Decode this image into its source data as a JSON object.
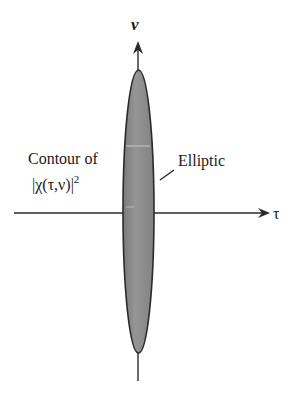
{
  "diagram": {
    "type": "ambiguity-function-contour",
    "axes": {
      "vertical_label": "ν",
      "horizontal_label": "τ"
    },
    "labels": {
      "contour_line1": "Contour of",
      "contour_line2": "|χ(τ,ν)|",
      "contour_exponent": "2",
      "shape": "Elliptic"
    },
    "colors": {
      "ellipse_fill": "#8a8a8a",
      "ellipse_stroke": "#2a2a2a",
      "axis": "#2a2a2a",
      "text": "#1a1a1a"
    }
  }
}
